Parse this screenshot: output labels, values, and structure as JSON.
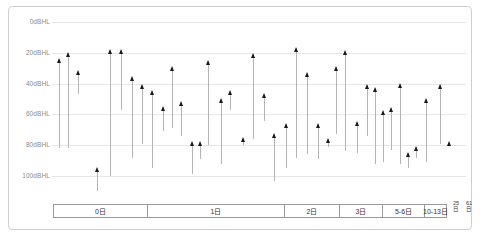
{
  "chart_data": {
    "type": "scatter",
    "title": "",
    "xlabel": "",
    "ylabel": "dBHL",
    "ylim": [
      0,
      110
    ],
    "y_inverted": true,
    "grid": true,
    "legend": "none",
    "y_ticks": [
      {
        "value": 0,
        "label": "0dBHL"
      },
      {
        "value": 20,
        "label": "20dBHL"
      },
      {
        "value": 40,
        "label": "40dBHL"
      },
      {
        "value": 60,
        "label": "60dBHL"
      },
      {
        "value": 80,
        "label": "80dBHL"
      },
      {
        "value": 100,
        "label": "100dBHL"
      }
    ],
    "x_categories": [
      {
        "label": "0日",
        "width": 95
      },
      {
        "label": "1日",
        "width": 137
      },
      {
        "label": "2日",
        "width": 55
      },
      {
        "label": "3日",
        "width": 43
      },
      {
        "label": "5-6日",
        "width": 42
      },
      {
        "label": "10-13日",
        "width": 22
      }
    ],
    "x_tail_labels": [
      "25日",
      "61日"
    ],
    "series_name": "hearing-threshold",
    "marker": "triangle-up",
    "marker_color": "#1a1a1a",
    "whisker_color": "#b4b4b4",
    "note": "each point is a marker at the upper (better) threshold with a vertical line dropping to the lower (worse) threshold",
    "points": [
      {
        "x": 59,
        "top": 24,
        "bottom": 82
      },
      {
        "x": 68,
        "top": 20,
        "bottom": 82
      },
      {
        "x": 78,
        "top": 32,
        "bottom": 47
      },
      {
        "x": 97,
        "top": 95,
        "bottom": 110
      },
      {
        "x": 110,
        "top": 18,
        "bottom": 100
      },
      {
        "x": 121,
        "top": 18,
        "bottom": 57
      },
      {
        "x": 132,
        "top": 36,
        "bottom": 88
      },
      {
        "x": 142,
        "top": 41,
        "bottom": 79
      },
      {
        "x": 152,
        "top": 45,
        "bottom": 95
      },
      {
        "x": 163,
        "top": 55,
        "bottom": 71
      },
      {
        "x": 172,
        "top": 29,
        "bottom": 69
      },
      {
        "x": 181,
        "top": 52,
        "bottom": 74
      },
      {
        "x": 192,
        "top": 78,
        "bottom": 99
      },
      {
        "x": 200,
        "top": 78,
        "bottom": 89
      },
      {
        "x": 208,
        "top": 25,
        "bottom": 80
      },
      {
        "x": 221,
        "top": 50,
        "bottom": 92
      },
      {
        "x": 230,
        "top": 45,
        "bottom": 57
      },
      {
        "x": 243,
        "top": 75,
        "bottom": 80
      },
      {
        "x": 253,
        "top": 21,
        "bottom": 76
      },
      {
        "x": 264,
        "top": 47,
        "bottom": 64
      },
      {
        "x": 274,
        "top": 73,
        "bottom": 103
      },
      {
        "x": 286,
        "top": 66,
        "bottom": 95
      },
      {
        "x": 296,
        "top": 17,
        "bottom": 88
      },
      {
        "x": 307,
        "top": 33,
        "bottom": 86
      },
      {
        "x": 318,
        "top": 66,
        "bottom": 89
      },
      {
        "x": 328,
        "top": 76,
        "bottom": 81
      },
      {
        "x": 336,
        "top": 29,
        "bottom": 73
      },
      {
        "x": 345,
        "top": 19,
        "bottom": 84
      },
      {
        "x": 357,
        "top": 65,
        "bottom": 85
      },
      {
        "x": 367,
        "top": 41,
        "bottom": 74
      },
      {
        "x": 375,
        "top": 43,
        "bottom": 92
      },
      {
        "x": 383,
        "top": 58,
        "bottom": 91
      },
      {
        "x": 391,
        "top": 56,
        "bottom": 83
      },
      {
        "x": 400,
        "top": 40,
        "bottom": 92
      },
      {
        "x": 408,
        "top": 85,
        "bottom": 95
      },
      {
        "x": 416,
        "top": 81,
        "bottom": 88
      },
      {
        "x": 426,
        "top": 50,
        "bottom": 91
      },
      {
        "x": 440,
        "top": 41,
        "bottom": 79
      },
      {
        "x": 449,
        "top": 78,
        "bottom": 79
      }
    ]
  }
}
